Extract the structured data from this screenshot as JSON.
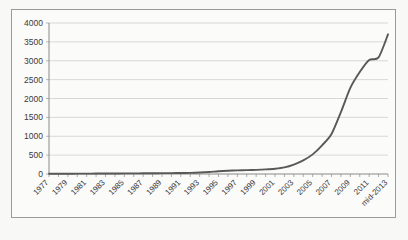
{
  "chart_data": {
    "type": "line",
    "title": "",
    "subtitle": "",
    "xlabel": "",
    "ylabel": "",
    "ylim": [
      0,
      4000
    ],
    "ytick_step": 500,
    "yticks": [
      "0",
      "500",
      "1000",
      "1500",
      "2000",
      "2500",
      "3000",
      "3500",
      "4000"
    ],
    "grid": true,
    "legend": false,
    "legend_position": "none",
    "line_color": "#595959",
    "plot_background": "#fbfbfa",
    "gridline_color": "#c8c8c8",
    "axis_color": "#8a8a8a",
    "border_color": "#9a9a9a",
    "x_tick_labels": [
      "1977",
      "1979",
      "1981",
      "1983",
      "1985",
      "1987",
      "1989",
      "1991",
      "1993",
      "1995",
      "1997",
      "1999",
      "2001",
      "2003",
      "2005",
      "2007",
      "2009",
      "2011",
      "mid-2013"
    ],
    "x_label_rotation_deg": 45,
    "x_minor_ticks_every_year": true,
    "x": [
      1977,
      1978,
      1979,
      1980,
      1981,
      1982,
      1983,
      1984,
      1985,
      1986,
      1987,
      1988,
      1989,
      1990,
      1991,
      1992,
      1993,
      1994,
      1995,
      1996,
      1997,
      1998,
      1999,
      2000,
      2001,
      2002,
      2003,
      2004,
      2005,
      2006,
      2007,
      2008,
      2009,
      2010,
      2011,
      2012,
      2013
    ],
    "series": [
      {
        "name": "value",
        "values": [
          5,
          6,
          8,
          9,
          10,
          12,
          13,
          14,
          16,
          17,
          18,
          20,
          22,
          24,
          26,
          30,
          38,
          52,
          72,
          86,
          95,
          102,
          110,
          122,
          140,
          175,
          250,
          360,
          520,
          760,
          1060,
          1640,
          2280,
          2700,
          3020,
          3090,
          3700
        ]
      }
    ]
  }
}
